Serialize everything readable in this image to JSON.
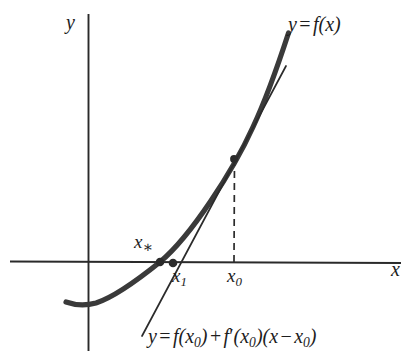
{
  "figure": {
    "kind": "newton-method-diagram",
    "background_color": "#ffffff",
    "ink_color": "#1d1d1d",
    "curve_color": "#3a3a3a",
    "axes": {
      "y_axis_label": "y",
      "x_axis_label": "x",
      "x_axis": {
        "x1": 10,
        "y1": 261,
        "x2": 401,
        "y2": 263
      },
      "y_axis": {
        "x1": 88,
        "y1": 14,
        "x2": 89,
        "y2": 351
      },
      "stroke_width": 1.8
    },
    "curve": {
      "label_text": "y = f(x)",
      "label_y": "y",
      "label_eq": "=",
      "label_f": "f",
      "label_arg": "(x)",
      "stroke_width": 5.2,
      "path": "M 66,302 C 76,305 84,306 95,303 C 112,298 133,284 160,262 C 190,236 232,170 253,127 C 268,95 281,56 288,33"
    },
    "tangent": {
      "stroke_width": 1.6,
      "path_x1": 142,
      "path_y1": 336,
      "path_x2": 286,
      "path_y2": 66,
      "equation": {
        "lhs": "y",
        "eq": "=",
        "f1": "f",
        "arg1_open": "(x",
        "arg1_sub": "0",
        "arg1_close": ")",
        "plus": "+",
        "f2": "f",
        "prime": "′",
        "arg2_open": "(x",
        "arg2_sub": "0",
        "arg2_close": ")",
        "arg3_open": "(x",
        "minus": "−",
        "arg3_x": "x",
        "arg3_sub": "0",
        "arg3_close": ")"
      }
    },
    "dashed_drop_line": {
      "x1": 235,
      "y1": 159,
      "x2": 234,
      "y2": 262,
      "dash_pattern": "7 5",
      "stroke_width": 1.6
    },
    "points": [
      {
        "name": "root-point",
        "label": "x",
        "sub": "∗",
        "cx": 160,
        "cy": 262,
        "r": 4.2
      },
      {
        "name": "x1-point",
        "label": "x",
        "sub": "1",
        "cx": 173,
        "cy": 263,
        "r": 4.2
      },
      {
        "name": "tangency-point",
        "label": "",
        "sub": "",
        "cx": 234,
        "cy": 159,
        "r": 3.8
      }
    ],
    "x0": {
      "label": "x",
      "sub": "0"
    }
  }
}
